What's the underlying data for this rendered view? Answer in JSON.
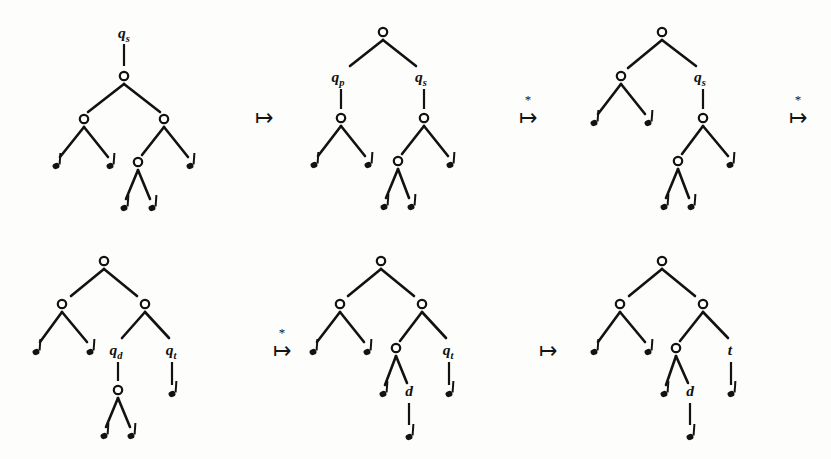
{
  "figure": {
    "background_color": "#fdfdfc",
    "ink_color": "#121212",
    "node_fill_color": "#ffffff",
    "width": 831,
    "height": 459
  },
  "arrows": [
    {
      "id": "arrow-1",
      "symbol": "↦",
      "star": "",
      "x": 264,
      "y": 125,
      "star_x": 264,
      "star_y": 104
    },
    {
      "id": "arrow-2",
      "symbol": "↦",
      "star": "*",
      "x": 528,
      "y": 125,
      "star_x": 528,
      "star_y": 104
    },
    {
      "id": "arrow-3",
      "symbol": "↦",
      "star": "*",
      "x": 798,
      "y": 125,
      "star_x": 798,
      "star_y": 104
    },
    {
      "id": "arrow-4",
      "symbol": "↦",
      "star": "*",
      "x": 282,
      "y": 358,
      "star_x": 282,
      "star_y": 337
    },
    {
      "id": "arrow-5",
      "symbol": "↦",
      "star": "",
      "x": 548,
      "y": 358,
      "star_x": 548,
      "star_y": 337
    }
  ],
  "trees": [
    {
      "id": "tree-1",
      "name": "tree-step-1",
      "root_label": {
        "base": "q",
        "sub": "s",
        "x": 124,
        "y": 38
      },
      "root_stem": {
        "x": 124,
        "y1": 44,
        "y2": 66
      },
      "nodes": [
        {
          "id": "n-root",
          "x": 124,
          "y": 76
        },
        {
          "id": "n-left",
          "x": 84,
          "y": 119
        },
        {
          "id": "n-right",
          "x": 164,
          "y": 119
        },
        {
          "id": "n-rl",
          "x": 138,
          "y": 162
        }
      ],
      "leaves": [
        {
          "id": "l-1",
          "x": 56,
          "y": 166
        },
        {
          "id": "l-2",
          "x": 110,
          "y": 166
        },
        {
          "id": "l-3",
          "x": 190,
          "y": 166
        },
        {
          "id": "l-4",
          "x": 124,
          "y": 208
        },
        {
          "id": "l-5",
          "x": 152,
          "y": 208
        }
      ],
      "edges": [
        {
          "x1": 124,
          "y1": 84,
          "x2": 88,
          "y2": 112
        },
        {
          "x1": 124,
          "y1": 84,
          "x2": 160,
          "y2": 112
        },
        {
          "x1": 84,
          "y1": 127,
          "x2": 60,
          "y2": 157
        },
        {
          "x1": 84,
          "y1": 127,
          "x2": 108,
          "y2": 157
        },
        {
          "x1": 164,
          "y1": 127,
          "x2": 142,
          "y2": 155
        },
        {
          "x1": 164,
          "y1": 127,
          "x2": 188,
          "y2": 157
        },
        {
          "x1": 138,
          "y1": 170,
          "x2": 126,
          "y2": 199
        },
        {
          "x1": 138,
          "y1": 170,
          "x2": 150,
          "y2": 199
        }
      ],
      "edge_labels": []
    },
    {
      "id": "tree-2",
      "name": "tree-step-2",
      "root_label": null,
      "root_stem": null,
      "nodes": [
        {
          "id": "n-root",
          "x": 383,
          "y": 32
        },
        {
          "id": "n-left",
          "x": 341,
          "y": 118
        },
        {
          "id": "n-right",
          "x": 424,
          "y": 118
        },
        {
          "id": "n-rl",
          "x": 398,
          "y": 161
        }
      ],
      "leaves": [
        {
          "id": "l-1",
          "x": 314,
          "y": 165
        },
        {
          "id": "l-2",
          "x": 368,
          "y": 165
        },
        {
          "id": "l-3",
          "x": 450,
          "y": 165
        },
        {
          "id": "l-4",
          "x": 384,
          "y": 207
        },
        {
          "id": "l-5",
          "x": 411,
          "y": 207
        }
      ],
      "edges": [
        {
          "x1": 383,
          "y1": 40,
          "x2": 350,
          "y2": 66
        },
        {
          "x1": 383,
          "y1": 40,
          "x2": 416,
          "y2": 66
        },
        {
          "x1": 341,
          "y1": 126,
          "x2": 318,
          "y2": 156
        },
        {
          "x1": 341,
          "y1": 126,
          "x2": 365,
          "y2": 156
        },
        {
          "x1": 424,
          "y1": 126,
          "x2": 402,
          "y2": 154
        },
        {
          "x1": 424,
          "y1": 126,
          "x2": 448,
          "y2": 156
        },
        {
          "x1": 398,
          "y1": 169,
          "x2": 386,
          "y2": 198
        },
        {
          "x1": 398,
          "y1": 169,
          "x2": 409,
          "y2": 198
        }
      ],
      "edge_labels": [
        {
          "base": "q",
          "sub": "p",
          "x": 338,
          "y": 82,
          "stem": {
            "x": 341,
            "y1": 89,
            "y2": 109
          }
        },
        {
          "base": "q",
          "sub": "s",
          "x": 421,
          "y": 82,
          "stem": {
            "x": 424,
            "y1": 89,
            "y2": 109
          }
        }
      ]
    },
    {
      "id": "tree-3",
      "name": "tree-step-3",
      "root_label": null,
      "root_stem": null,
      "nodes": [
        {
          "id": "n-root",
          "x": 662,
          "y": 32
        },
        {
          "id": "n-left",
          "x": 621,
          "y": 76
        },
        {
          "id": "n-right",
          "x": 703,
          "y": 118
        },
        {
          "id": "n-rl",
          "x": 678,
          "y": 161
        }
      ],
      "leaves": [
        {
          "id": "l-1",
          "x": 594,
          "y": 123
        },
        {
          "id": "l-2",
          "x": 648,
          "y": 123
        },
        {
          "id": "l-3",
          "x": 730,
          "y": 165
        },
        {
          "id": "l-4",
          "x": 664,
          "y": 207
        },
        {
          "id": "l-5",
          "x": 691,
          "y": 207
        }
      ],
      "edges": [
        {
          "x1": 662,
          "y1": 40,
          "x2": 628,
          "y2": 68
        },
        {
          "x1": 662,
          "y1": 40,
          "x2": 696,
          "y2": 66
        },
        {
          "x1": 621,
          "y1": 84,
          "x2": 598,
          "y2": 114
        },
        {
          "x1": 621,
          "y1": 84,
          "x2": 645,
          "y2": 114
        },
        {
          "x1": 703,
          "y1": 126,
          "x2": 682,
          "y2": 154
        },
        {
          "x1": 703,
          "y1": 126,
          "x2": 728,
          "y2": 156
        },
        {
          "x1": 678,
          "y1": 169,
          "x2": 666,
          "y2": 198
        },
        {
          "x1": 678,
          "y1": 169,
          "x2": 689,
          "y2": 198
        }
      ],
      "edge_labels": [
        {
          "base": "q",
          "sub": "s",
          "x": 700,
          "y": 82,
          "stem": {
            "x": 703,
            "y1": 89,
            "y2": 109
          }
        }
      ]
    },
    {
      "id": "tree-4",
      "name": "tree-step-4",
      "root_label": null,
      "root_stem": null,
      "nodes": [
        {
          "id": "n-root",
          "x": 104,
          "y": 261
        },
        {
          "id": "n-left",
          "x": 62,
          "y": 304
        },
        {
          "id": "n-right",
          "x": 145,
          "y": 304
        },
        {
          "id": "n-rl",
          "x": 118,
          "y": 390
        }
      ],
      "leaves": [
        {
          "id": "l-1",
          "x": 36,
          "y": 352
        },
        {
          "id": "l-2",
          "x": 90,
          "y": 352
        },
        {
          "id": "l-3",
          "x": 172,
          "y": 394
        },
        {
          "id": "l-4",
          "x": 104,
          "y": 436
        },
        {
          "id": "l-5",
          "x": 131,
          "y": 436
        }
      ],
      "edges": [
        {
          "x1": 104,
          "y1": 269,
          "x2": 71,
          "y2": 296
        },
        {
          "x1": 104,
          "y1": 269,
          "x2": 137,
          "y2": 296
        },
        {
          "x1": 62,
          "y1": 312,
          "x2": 40,
          "y2": 342
        },
        {
          "x1": 62,
          "y1": 312,
          "x2": 87,
          "y2": 342
        },
        {
          "x1": 145,
          "y1": 312,
          "x2": 122,
          "y2": 338
        },
        {
          "x1": 145,
          "y1": 312,
          "x2": 169,
          "y2": 338
        },
        {
          "x1": 118,
          "y1": 398,
          "x2": 106,
          "y2": 427
        },
        {
          "x1": 118,
          "y1": 398,
          "x2": 130,
          "y2": 427
        }
      ],
      "edge_labels": [
        {
          "base": "q",
          "sub": "d",
          "x": 116,
          "y": 355,
          "stem": {
            "x": 118,
            "y1": 362,
            "y2": 381
          }
        },
        {
          "base": "q",
          "sub": "t",
          "x": 171,
          "y": 355,
          "stem": {
            "x": 172,
            "y1": 362,
            "y2": 385
          }
        }
      ]
    },
    {
      "id": "tree-5",
      "name": "tree-step-5",
      "root_label": null,
      "root_stem": null,
      "nodes": [
        {
          "id": "n-root",
          "x": 381,
          "y": 261
        },
        {
          "id": "n-left",
          "x": 340,
          "y": 304
        },
        {
          "id": "n-right",
          "x": 422,
          "y": 304
        },
        {
          "id": "n-rl",
          "x": 396,
          "y": 348
        }
      ],
      "leaves": [
        {
          "id": "l-1",
          "x": 313,
          "y": 352
        },
        {
          "id": "l-2",
          "x": 367,
          "y": 352
        },
        {
          "id": "l-3",
          "x": 449,
          "y": 394
        },
        {
          "id": "l-4",
          "x": 383,
          "y": 394
        },
        {
          "id": "l-5",
          "x": 409,
          "y": 437
        }
      ],
      "edges": [
        {
          "x1": 381,
          "y1": 269,
          "x2": 348,
          "y2": 296
        },
        {
          "x1": 381,
          "y1": 269,
          "x2": 414,
          "y2": 296
        },
        {
          "x1": 340,
          "y1": 312,
          "x2": 317,
          "y2": 342
        },
        {
          "x1": 340,
          "y1": 312,
          "x2": 364,
          "y2": 342
        },
        {
          "x1": 422,
          "y1": 312,
          "x2": 400,
          "y2": 341
        },
        {
          "x1": 422,
          "y1": 312,
          "x2": 446,
          "y2": 338
        },
        {
          "x1": 396,
          "y1": 356,
          "x2": 385,
          "y2": 385
        },
        {
          "x1": 396,
          "y1": 356,
          "x2": 407,
          "y2": 383
        }
      ],
      "edge_labels": [
        {
          "base": "d",
          "sub": "",
          "x": 409,
          "y": 396,
          "stem": {
            "x": 409,
            "y1": 403,
            "y2": 425
          }
        },
        {
          "base": "q",
          "sub": "t",
          "x": 448,
          "y": 355,
          "stem": {
            "x": 449,
            "y1": 362,
            "y2": 385
          }
        }
      ]
    },
    {
      "id": "tree-6",
      "name": "tree-step-6",
      "root_label": null,
      "root_stem": null,
      "nodes": [
        {
          "id": "n-root",
          "x": 662,
          "y": 261
        },
        {
          "id": "n-left",
          "x": 620,
          "y": 304
        },
        {
          "id": "n-right",
          "x": 703,
          "y": 304
        },
        {
          "id": "n-rl",
          "x": 676,
          "y": 348
        }
      ],
      "leaves": [
        {
          "id": "l-1",
          "x": 594,
          "y": 352
        },
        {
          "id": "l-2",
          "x": 648,
          "y": 352
        },
        {
          "id": "l-3",
          "x": 731,
          "y": 394
        },
        {
          "id": "l-4",
          "x": 664,
          "y": 394
        },
        {
          "id": "l-5",
          "x": 690,
          "y": 437
        }
      ],
      "edges": [
        {
          "x1": 662,
          "y1": 269,
          "x2": 629,
          "y2": 296
        },
        {
          "x1": 662,
          "y1": 269,
          "x2": 695,
          "y2": 296
        },
        {
          "x1": 620,
          "y1": 312,
          "x2": 598,
          "y2": 342
        },
        {
          "x1": 620,
          "y1": 312,
          "x2": 645,
          "y2": 342
        },
        {
          "x1": 703,
          "y1": 312,
          "x2": 680,
          "y2": 341
        },
        {
          "x1": 703,
          "y1": 312,
          "x2": 728,
          "y2": 338
        },
        {
          "x1": 676,
          "y1": 356,
          "x2": 666,
          "y2": 385
        },
        {
          "x1": 676,
          "y1": 356,
          "x2": 688,
          "y2": 383
        }
      ],
      "edge_labels": [
        {
          "base": "d",
          "sub": "",
          "x": 690,
          "y": 396,
          "stem": {
            "x": 690,
            "y1": 403,
            "y2": 425
          }
        },
        {
          "base": "t",
          "sub": "",
          "x": 730,
          "y": 355,
          "stem": {
            "x": 731,
            "y1": 362,
            "y2": 385
          }
        }
      ]
    }
  ]
}
